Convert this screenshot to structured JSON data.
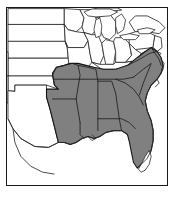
{
  "figure": {
    "type": "distribution-range-map",
    "region": "Eastern United States",
    "title": "",
    "caption": "",
    "background_color": "#ffffff",
    "frame": {
      "visible": true,
      "color": "#1a1a1a",
      "x": 6,
      "y": 7,
      "width": 162,
      "height": 179
    }
  },
  "map": {
    "projection_extent": {
      "west_label": "",
      "east_label": "",
      "north_label": "",
      "south_label": ""
    },
    "land_fill": "#ffffff",
    "border_color": "#2b2b2b",
    "range_fill": "#808080",
    "range_border": "#141414",
    "shaded_region_description": "Southeastern United States"
  },
  "legend": {
    "visible": false,
    "entries": [
      {
        "label": "",
        "swatch": "#808080"
      }
    ]
  },
  "states_shaded": [
    "Texas (east)",
    "Oklahoma (southeast)",
    "Arkansas",
    "Louisiana",
    "Mississippi",
    "Alabama",
    "Georgia",
    "Florida (except south tip)",
    "South Carolina",
    "North Carolina",
    "Tennessee",
    "Virginia (southeast)",
    "Kentucky (west)",
    "Missouri (south)"
  ],
  "states_unshaded": [
    "Colorado",
    "Kansas",
    "Nebraska",
    "South Dakota",
    "North Dakota",
    "Minnesota",
    "Iowa",
    "Wisconsin",
    "Michigan",
    "Illinois",
    "Indiana",
    "Ohio",
    "Pennsylvania",
    "New York",
    "New Mexico",
    "Oklahoma (west)",
    "West Virginia",
    "Maryland",
    "New Jersey"
  ],
  "water_features": [
    "Lake Michigan",
    "Lake Huron",
    "Lake Erie",
    "Lake Ontario",
    "Lake Superior",
    "Gulf of Mexico",
    "Atlantic Ocean",
    "Chesapeake Bay"
  ],
  "annotations": []
}
